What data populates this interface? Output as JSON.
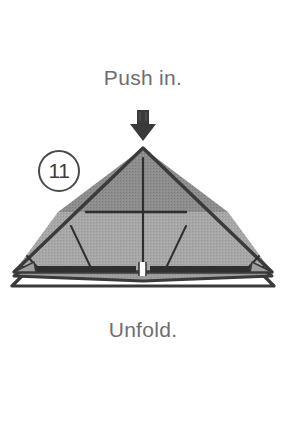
{
  "page": {
    "kind": "origami-instruction-step",
    "background_color": "#ffffff",
    "width": 286,
    "height": 440
  },
  "step": {
    "number_label": "11",
    "badge_shape": "circle",
    "badge_stroke_color": "#4a4a4a",
    "badge_text_color": "#3d3d3d"
  },
  "captions": {
    "top": "Push in.",
    "bottom": "Unfold.",
    "color": "#6e6e6e"
  },
  "arrow": {
    "name": "push-in-arrow",
    "direction": "down",
    "fill_color": "#3a3a3a"
  },
  "figure": {
    "name": "folded-paper-triangle",
    "outline_color": "#3a3a3a",
    "upper_face_color": "#8f8f8f",
    "lower_face_color": "#a8a8a8",
    "flap_top_color": "#9d9d9d",
    "flap_bottom_color": "#ffffff",
    "crease_color": "#2f2f2f",
    "apex": {
      "x": 143,
      "y": 148
    },
    "base_left": {
      "x": 14,
      "y": 272
    },
    "base_right": {
      "x": 272,
      "y": 272
    },
    "horizontal_crease_y": 212,
    "creases": [
      {
        "name": "vertical-center-crease",
        "x1": 143,
        "y1": 158,
        "x2": 143,
        "y2": 268
      },
      {
        "name": "horizontal-crease",
        "x1": 86,
        "y1": 212,
        "x2": 186,
        "y2": 212
      },
      {
        "name": "left-diagonal-crease",
        "x1": 71,
        "y1": 226,
        "x2": 91,
        "y2": 268
      },
      {
        "name": "right-diagonal-crease",
        "x1": 186,
        "y1": 226,
        "x2": 166,
        "y2": 268
      },
      {
        "name": "left-corner-tick",
        "x1": 28,
        "y1": 258,
        "x2": 38,
        "y2": 268
      },
      {
        "name": "right-corner-tick",
        "x1": 258,
        "y1": 258,
        "x2": 248,
        "y2": 268
      }
    ],
    "base_notch": {
      "name": "center-notch",
      "x": 143,
      "width": 6
    }
  }
}
